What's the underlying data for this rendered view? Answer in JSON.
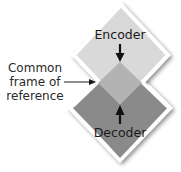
{
  "diagram": {
    "encoder": {
      "label": "Encoder",
      "fill": "#d9d9d9",
      "points": "122,5 168,55 120,63 76,55",
      "direction": "down"
    },
    "decoder": {
      "label": "Decoder",
      "fill": "#8a8a8a",
      "points": "120,103 170,97 118,160 73,105",
      "direction": "up"
    },
    "overlap": {
      "label_lines": [
        "Common",
        "frame of",
        "reference"
      ],
      "fill": "#b3b3b3"
    },
    "colors": {
      "background": "#ffffff",
      "outline": "#ffffff",
      "shadow": "#9a9a9a",
      "text": "#1a1a1a",
      "arrow": "#111111"
    }
  }
}
